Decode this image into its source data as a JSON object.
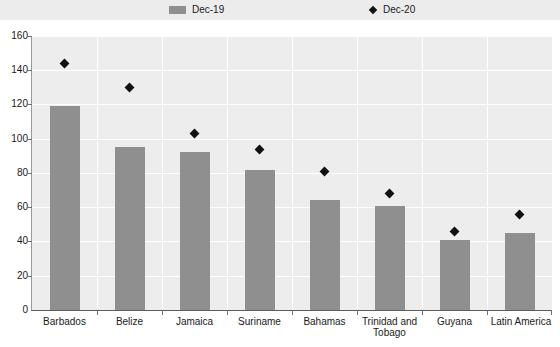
{
  "legend": {
    "entries": [
      {
        "label": "Dec-19",
        "marker": "square-swatch",
        "color": "#8f8f8f"
      },
      {
        "label": "Dec-20",
        "marker": "diamond-marker",
        "color": "#111111"
      }
    ]
  },
  "axes": {
    "y_ticks": [
      "0",
      "20",
      "40",
      "60",
      "80",
      "100",
      "120",
      "140",
      "160"
    ]
  },
  "chart_data": {
    "type": "bar",
    "title": "",
    "subtitle": "",
    "xlabel": "",
    "ylabel": "",
    "ylim": [
      0,
      160
    ],
    "ytick_step": 20,
    "grid": true,
    "legend_position": "top",
    "categories": [
      "Barbados",
      "Belize",
      "Jamaica",
      "Suriname",
      "Bahamas",
      "Trinidad and Tobago",
      "Guyana",
      "Latin America"
    ],
    "series": [
      {
        "name": "Dec-19",
        "type": "bar",
        "color": "#8f8f8f",
        "values": [
          119,
          95,
          92,
          82,
          64,
          61,
          41,
          45
        ]
      },
      {
        "name": "Dec-20",
        "type": "scatter",
        "marker": "diamond",
        "color": "#111111",
        "values": [
          144,
          130,
          103,
          94,
          81,
          68,
          46,
          56
        ]
      }
    ]
  }
}
